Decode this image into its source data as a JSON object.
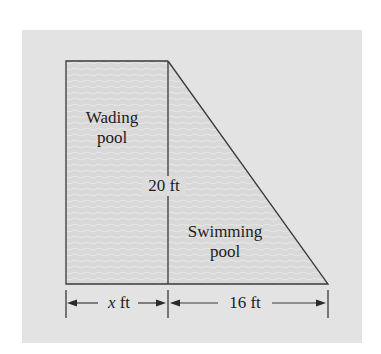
{
  "diagram": {
    "colors": {
      "page_background": "#ffffff",
      "panel_background": "#e3e3e3",
      "water_fill": "#d8d8d8",
      "wave_stroke": "#ececec",
      "outline": "#3a3a3a",
      "text": "#1c1c1c"
    },
    "regions": [
      {
        "id": "wading-pool",
        "label_line1": "Wading",
        "label_line2": "pool",
        "shape": "rectangle"
      },
      {
        "id": "swimming-pool",
        "label_line1": "Swimming",
        "label_line2": "pool",
        "shape": "right-triangle"
      }
    ],
    "dimensions": {
      "height_label": "20 ft",
      "wading_width_var": "x",
      "wading_width_unit": " ft",
      "swimming_width_label": "16 ft"
    }
  }
}
